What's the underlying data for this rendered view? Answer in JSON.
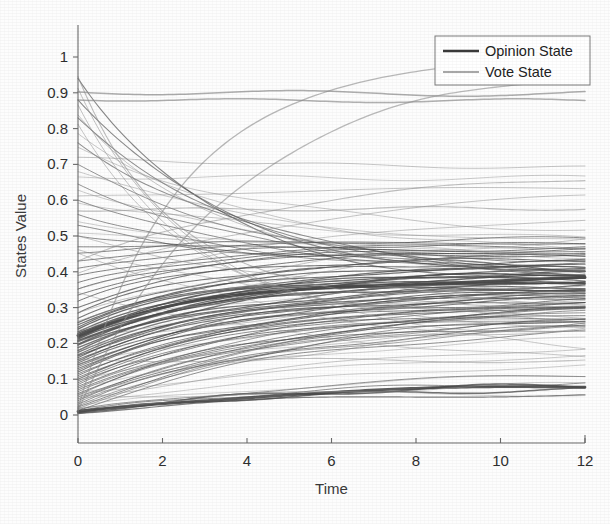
{
  "figure": {
    "width": 610,
    "height": 524,
    "background": "#fdfdfd"
  },
  "chart_data": {
    "type": "line",
    "title": "",
    "xlabel": "Time",
    "ylabel": "States Value",
    "xlim": [
      0,
      12
    ],
    "ylim": [
      -0.06,
      1.08
    ],
    "xticks": [
      0,
      2,
      4,
      6,
      8,
      10,
      12
    ],
    "xtick_labels": [
      "0",
      "2",
      "4",
      "6",
      "8",
      "10",
      "12"
    ],
    "yticks": [
      0,
      0.1,
      0.2,
      0.3,
      0.4,
      0.5,
      0.6,
      0.7,
      0.8,
      0.9,
      1
    ],
    "ytick_labels": [
      "0",
      "0.1",
      "0.2",
      "0.3",
      "0.4",
      "0.5",
      "0.6",
      "0.7",
      "0.8",
      "0.9",
      "1"
    ],
    "grid": false,
    "legend": {
      "position": "top-right",
      "entries": [
        {
          "name": "Opinion State",
          "color": "#3a3a3a",
          "width": 2.6
        },
        {
          "name": "Vote State",
          "color": "#8a8a8a",
          "width": 1.6
        }
      ]
    },
    "series": [
      {
        "name": "Opinion State",
        "color": "#4a4a4a",
        "width": 1.1,
        "opacity": 0.72,
        "description": "Dense family of opinion trajectories converging toward a consensus band near 0.36-0.45 at t=12",
        "curves": [
          {
            "y0": 0.222,
            "yinf": 0.385,
            "rate": 0.3,
            "w": 3.0,
            "op": 0.95
          },
          {
            "y0": 0.01,
            "yinf": 0.082,
            "rate": 0.22,
            "w": 2.8,
            "op": 0.9
          },
          {
            "y0": 0.205,
            "yinf": 0.38,
            "rate": 0.3,
            "w": 1.6,
            "op": 0.8
          },
          {
            "y0": 0.215,
            "yinf": 0.392,
            "rate": 0.31,
            "w": 1.5,
            "op": 0.8
          },
          {
            "y0": 0.195,
            "yinf": 0.372,
            "rate": 0.29,
            "w": 1.4,
            "op": 0.78
          },
          {
            "y0": 0.188,
            "yinf": 0.366,
            "rate": 0.28,
            "w": 1.3,
            "op": 0.75
          },
          {
            "y0": 0.175,
            "yinf": 0.36,
            "rate": 0.28,
            "w": 1.2,
            "op": 0.72
          },
          {
            "y0": 0.165,
            "yinf": 0.352,
            "rate": 0.27,
            "w": 1.2,
            "op": 0.72
          },
          {
            "y0": 0.155,
            "yinf": 0.345,
            "rate": 0.27,
            "w": 1.1,
            "op": 0.7
          },
          {
            "y0": 0.145,
            "yinf": 0.34,
            "rate": 0.26,
            "w": 1.1,
            "op": 0.7
          },
          {
            "y0": 0.135,
            "yinf": 0.334,
            "rate": 0.26,
            "w": 1.0,
            "op": 0.68
          },
          {
            "y0": 0.125,
            "yinf": 0.328,
            "rate": 0.25,
            "w": 1.0,
            "op": 0.68
          },
          {
            "y0": 0.115,
            "yinf": 0.322,
            "rate": 0.25,
            "w": 1.0,
            "op": 0.66
          },
          {
            "y0": 0.105,
            "yinf": 0.318,
            "rate": 0.24,
            "w": 1.0,
            "op": 0.66
          },
          {
            "y0": 0.095,
            "yinf": 0.312,
            "rate": 0.24,
            "w": 0.95,
            "op": 0.64
          },
          {
            "y0": 0.085,
            "yinf": 0.306,
            "rate": 0.23,
            "w": 0.95,
            "op": 0.64
          },
          {
            "y0": 0.075,
            "yinf": 0.3,
            "rate": 0.23,
            "w": 0.9,
            "op": 0.62
          },
          {
            "y0": 0.065,
            "yinf": 0.296,
            "rate": 0.22,
            "w": 0.9,
            "op": 0.62
          },
          {
            "y0": 0.055,
            "yinf": 0.29,
            "rate": 0.22,
            "w": 0.9,
            "op": 0.6
          },
          {
            "y0": 0.045,
            "yinf": 0.285,
            "rate": 0.21,
            "w": 0.9,
            "op": 0.6
          },
          {
            "y0": 0.035,
            "yinf": 0.28,
            "rate": 0.21,
            "w": 0.85,
            "op": 0.58
          },
          {
            "y0": 0.025,
            "yinf": 0.272,
            "rate": 0.2,
            "w": 0.85,
            "op": 0.58
          },
          {
            "y0": 0.018,
            "yinf": 0.265,
            "rate": 0.2,
            "w": 0.85,
            "op": 0.56
          },
          {
            "y0": 0.232,
            "yinf": 0.4,
            "rate": 0.31,
            "w": 1.3,
            "op": 0.78
          },
          {
            "y0": 0.245,
            "yinf": 0.412,
            "rate": 0.32,
            "w": 1.2,
            "op": 0.76
          },
          {
            "y0": 0.258,
            "yinf": 0.42,
            "rate": 0.32,
            "w": 1.2,
            "op": 0.76
          },
          {
            "y0": 0.27,
            "yinf": 0.43,
            "rate": 0.33,
            "w": 1.1,
            "op": 0.74
          },
          {
            "y0": 0.285,
            "yinf": 0.438,
            "rate": 0.33,
            "w": 1.1,
            "op": 0.74
          },
          {
            "y0": 0.3,
            "yinf": 0.445,
            "rate": 0.33,
            "w": 1.1,
            "op": 0.72
          },
          {
            "y0": 0.318,
            "yinf": 0.452,
            "rate": 0.34,
            "w": 1.0,
            "op": 0.72
          },
          {
            "y0": 0.335,
            "yinf": 0.458,
            "rate": 0.34,
            "w": 1.0,
            "op": 0.7
          },
          {
            "y0": 0.352,
            "yinf": 0.462,
            "rate": 0.34,
            "w": 1.0,
            "op": 0.7
          },
          {
            "y0": 0.37,
            "yinf": 0.468,
            "rate": 0.33,
            "w": 1.0,
            "op": 0.68
          },
          {
            "y0": 0.39,
            "yinf": 0.474,
            "rate": 0.32,
            "w": 1.0,
            "op": 0.68
          },
          {
            "y0": 0.41,
            "yinf": 0.48,
            "rate": 0.31,
            "w": 1.0,
            "op": 0.66
          },
          {
            "y0": 0.43,
            "yinf": 0.486,
            "rate": 0.3,
            "w": 1.0,
            "op": 0.66
          },
          {
            "y0": 0.452,
            "yinf": 0.492,
            "rate": 0.29,
            "w": 1.0,
            "op": 0.64
          },
          {
            "y0": 0.47,
            "yinf": 0.462,
            "rate": 0.26,
            "w": 1.0,
            "op": 0.64
          },
          {
            "y0": 0.5,
            "yinf": 0.432,
            "rate": 0.25,
            "w": 1.0,
            "op": 0.62
          },
          {
            "y0": 0.53,
            "yinf": 0.41,
            "rate": 0.24,
            "w": 1.0,
            "op": 0.62
          },
          {
            "y0": 0.56,
            "yinf": 0.398,
            "rate": 0.23,
            "w": 1.0,
            "op": 0.6
          },
          {
            "y0": 0.6,
            "yinf": 0.392,
            "rate": 0.22,
            "w": 1.0,
            "op": 0.6
          },
          {
            "y0": 0.645,
            "yinf": 0.386,
            "rate": 0.21,
            "w": 1.0,
            "op": 0.58
          },
          {
            "y0": 0.7,
            "yinf": 0.38,
            "rate": 0.21,
            "w": 1.0,
            "op": 0.58
          },
          {
            "y0": 0.76,
            "yinf": 0.374,
            "rate": 0.22,
            "w": 1.05,
            "op": 0.6
          },
          {
            "y0": 0.83,
            "yinf": 0.368,
            "rate": 0.24,
            "w": 1.05,
            "op": 0.62
          },
          {
            "y0": 0.88,
            "yinf": 0.36,
            "rate": 0.26,
            "w": 1.05,
            "op": 0.64
          },
          {
            "y0": 0.94,
            "yinf": 0.352,
            "rate": 0.3,
            "w": 1.1,
            "op": 0.66
          },
          {
            "y0": 0.208,
            "yinf": 0.376,
            "rate": 0.295,
            "w": 1.5,
            "op": 0.82
          },
          {
            "y0": 0.198,
            "yinf": 0.384,
            "rate": 0.305,
            "w": 1.4,
            "op": 0.8
          },
          {
            "y0": 0.18,
            "yinf": 0.37,
            "rate": 0.285,
            "w": 1.3,
            "op": 0.78
          },
          {
            "y0": 0.16,
            "yinf": 0.356,
            "rate": 0.275,
            "w": 1.2,
            "op": 0.76
          },
          {
            "y0": 0.14,
            "yinf": 0.342,
            "rate": 0.265,
            "w": 1.2,
            "op": 0.74
          },
          {
            "y0": 0.12,
            "yinf": 0.33,
            "rate": 0.255,
            "w": 1.1,
            "op": 0.72
          },
          {
            "y0": 0.1,
            "yinf": 0.316,
            "rate": 0.245,
            "w": 1.1,
            "op": 0.7
          },
          {
            "y0": 0.08,
            "yinf": 0.304,
            "rate": 0.235,
            "w": 1.0,
            "op": 0.68
          },
          {
            "y0": 0.06,
            "yinf": 0.292,
            "rate": 0.225,
            "w": 1.0,
            "op": 0.66
          },
          {
            "y0": 0.04,
            "yinf": 0.282,
            "rate": 0.215,
            "w": 1.0,
            "op": 0.64
          },
          {
            "y0": 0.022,
            "yinf": 0.268,
            "rate": 0.205,
            "w": 1.0,
            "op": 0.62
          },
          {
            "y0": 0.012,
            "yinf": 0.255,
            "rate": 0.195,
            "w": 1.0,
            "op": 0.6
          },
          {
            "y0": 0.006,
            "yinf": 0.09,
            "rate": 0.2,
            "w": 1.6,
            "op": 0.8
          },
          {
            "y0": 0.008,
            "yinf": 0.076,
            "rate": 0.21,
            "w": 1.5,
            "op": 0.78
          },
          {
            "y0": 0.004,
            "yinf": 0.066,
            "rate": 0.19,
            "w": 1.2,
            "op": 0.7
          },
          {
            "y0": 0.012,
            "yinf": 0.1,
            "rate": 0.18,
            "w": 1.0,
            "op": 0.6
          },
          {
            "y0": 0.016,
            "yinf": 0.126,
            "rate": 0.16,
            "w": 1.0,
            "op": 0.58
          },
          {
            "y0": 0.228,
            "yinf": 0.398,
            "rate": 0.315,
            "w": 1.6,
            "op": 0.86
          },
          {
            "y0": 0.218,
            "yinf": 0.39,
            "rate": 0.308,
            "w": 1.5,
            "op": 0.84
          },
          {
            "y0": 0.212,
            "yinf": 0.382,
            "rate": 0.3,
            "w": 1.4,
            "op": 0.82
          },
          {
            "y0": 0.24,
            "yinf": 0.405,
            "rate": 0.318,
            "w": 1.3,
            "op": 0.8
          },
          {
            "y0": 0.252,
            "yinf": 0.415,
            "rate": 0.322,
            "w": 1.2,
            "op": 0.78
          },
          {
            "y0": 0.168,
            "yinf": 0.358,
            "rate": 0.272,
            "w": 1.2,
            "op": 0.74
          },
          {
            "y0": 0.15,
            "yinf": 0.348,
            "rate": 0.262,
            "w": 1.1,
            "op": 0.72
          },
          {
            "y0": 0.13,
            "yinf": 0.336,
            "rate": 0.252,
            "w": 1.1,
            "op": 0.7
          },
          {
            "y0": 0.11,
            "yinf": 0.324,
            "rate": 0.242,
            "w": 1.0,
            "op": 0.68
          },
          {
            "y0": 0.09,
            "yinf": 0.31,
            "rate": 0.232,
            "w": 1.0,
            "op": 0.66
          },
          {
            "y0": 0.07,
            "yinf": 0.298,
            "rate": 0.222,
            "w": 1.0,
            "op": 0.64
          },
          {
            "y0": 0.05,
            "yinf": 0.288,
            "rate": 0.212,
            "w": 1.0,
            "op": 0.62
          },
          {
            "y0": 0.03,
            "yinf": 0.276,
            "rate": 0.202,
            "w": 1.0,
            "op": 0.6
          }
        ]
      },
      {
        "name": "Vote State",
        "color": "#8e8e8e",
        "width": 1.0,
        "opacity": 0.55,
        "description": "Lighter vote trajectories including stubborn agents held near 0.90 and 0.88, slow risers to 0.97, and decliners",
        "curves": [
          {
            "y0": 0.902,
            "yinf": 0.898,
            "rate": 0.4,
            "w": 1.5,
            "op": 0.72
          },
          {
            "y0": 0.88,
            "yinf": 0.878,
            "rate": 0.4,
            "w": 1.5,
            "op": 0.7
          },
          {
            "y0": 0.018,
            "yinf": 0.99,
            "rate": 0.42,
            "w": 1.3,
            "op": 0.62
          },
          {
            "y0": 0.012,
            "yinf": 0.985,
            "rate": 0.27,
            "w": 1.3,
            "op": 0.6
          },
          {
            "y0": 0.665,
            "yinf": 0.662,
            "rate": 0.4,
            "w": 1.0,
            "op": 0.45
          },
          {
            "y0": 0.57,
            "yinf": 0.578,
            "rate": 0.22,
            "w": 1.2,
            "op": 0.55
          },
          {
            "y0": 0.155,
            "yinf": 0.152,
            "rate": 0.4,
            "w": 1.1,
            "op": 0.5
          },
          {
            "y0": 0.72,
            "yinf": 0.686,
            "rate": 0.16,
            "w": 1.0,
            "op": 0.5
          },
          {
            "y0": 0.612,
            "yinf": 0.638,
            "rate": 0.14,
            "w": 1.0,
            "op": 0.5
          },
          {
            "y0": 0.43,
            "yinf": 0.69,
            "rate": 0.18,
            "w": 1.1,
            "op": 0.55
          },
          {
            "y0": 0.396,
            "yinf": 0.64,
            "rate": 0.17,
            "w": 1.0,
            "op": 0.52
          },
          {
            "y0": 0.352,
            "yinf": 0.582,
            "rate": 0.16,
            "w": 1.0,
            "op": 0.5
          },
          {
            "y0": 0.285,
            "yinf": 0.53,
            "rate": 0.15,
            "w": 1.0,
            "op": 0.5
          },
          {
            "y0": 0.262,
            "yinf": 0.498,
            "rate": 0.15,
            "w": 1.0,
            "op": 0.48
          },
          {
            "y0": 0.5,
            "yinf": 0.262,
            "rate": 0.13,
            "w": 1.0,
            "op": 0.5
          },
          {
            "y0": 0.462,
            "yinf": 0.196,
            "rate": 0.12,
            "w": 1.0,
            "op": 0.5
          },
          {
            "y0": 0.452,
            "yinf": 0.122,
            "rate": 0.13,
            "w": 1.0,
            "op": 0.48
          },
          {
            "y0": 0.342,
            "yinf": 0.118,
            "rate": 0.14,
            "w": 1.0,
            "op": 0.48
          },
          {
            "y0": 0.06,
            "yinf": 0.312,
            "rate": 0.11,
            "w": 1.0,
            "op": 0.5
          },
          {
            "y0": 0.046,
            "yinf": 0.254,
            "rate": 0.1,
            "w": 1.0,
            "op": 0.48
          },
          {
            "y0": 0.058,
            "yinf": 0.2,
            "rate": 0.12,
            "w": 1.0,
            "op": 0.46
          },
          {
            "y0": 0.054,
            "yinf": 0.06,
            "rate": 0.2,
            "w": 1.0,
            "op": 0.42
          },
          {
            "y0": 0.838,
            "yinf": 0.386,
            "rate": 0.3,
            "w": 1.0,
            "op": 0.5
          },
          {
            "y0": 0.786,
            "yinf": 0.452,
            "rate": 0.26,
            "w": 1.0,
            "op": 0.48
          },
          {
            "y0": 0.748,
            "yinf": 0.5,
            "rate": 0.22,
            "w": 1.0,
            "op": 0.48
          },
          {
            "y0": 0.68,
            "yinf": 0.466,
            "rate": 0.2,
            "w": 1.0,
            "op": 0.46
          },
          {
            "y0": 0.628,
            "yinf": 0.42,
            "rate": 0.19,
            "w": 1.0,
            "op": 0.46
          },
          {
            "y0": 0.592,
            "yinf": 0.478,
            "rate": 0.17,
            "w": 1.0,
            "op": 0.46
          },
          {
            "y0": 0.54,
            "yinf": 0.436,
            "rate": 0.18,
            "w": 1.0,
            "op": 0.44
          },
          {
            "y0": 0.508,
            "yinf": 0.462,
            "rate": 0.16,
            "w": 1.0,
            "op": 0.44
          },
          {
            "y0": 0.945,
            "yinf": 0.304,
            "rate": 0.44,
            "w": 1.1,
            "op": 0.58
          },
          {
            "y0": 0.912,
            "yinf": 0.268,
            "rate": 0.4,
            "w": 1.0,
            "op": 0.54
          },
          {
            "y0": 0.866,
            "yinf": 0.24,
            "rate": 0.36,
            "w": 1.0,
            "op": 0.52
          },
          {
            "y0": 0.812,
            "yinf": 0.214,
            "rate": 0.32,
            "w": 1.0,
            "op": 0.5
          },
          {
            "y0": 0.236,
            "yinf": 0.372,
            "rate": 0.24,
            "w": 1.0,
            "op": 0.5
          },
          {
            "y0": 0.206,
            "yinf": 0.344,
            "rate": 0.22,
            "w": 1.0,
            "op": 0.48
          },
          {
            "y0": 0.182,
            "yinf": 0.326,
            "rate": 0.21,
            "w": 1.0,
            "op": 0.48
          },
          {
            "y0": 0.142,
            "yinf": 0.29,
            "rate": 0.19,
            "w": 1.0,
            "op": 0.46
          },
          {
            "y0": 0.098,
            "yinf": 0.262,
            "rate": 0.17,
            "w": 1.0,
            "op": 0.46
          },
          {
            "y0": 0.076,
            "yinf": 0.236,
            "rate": 0.16,
            "w": 1.0,
            "op": 0.44
          },
          {
            "y0": 0.034,
            "yinf": 0.162,
            "rate": 0.14,
            "w": 1.0,
            "op": 0.44
          },
          {
            "y0": 0.026,
            "yinf": 0.134,
            "rate": 0.13,
            "w": 1.0,
            "op": 0.42
          },
          {
            "y0": 0.02,
            "yinf": 0.108,
            "rate": 0.12,
            "w": 1.0,
            "op": 0.42
          }
        ]
      }
    ]
  },
  "geometry": {
    "plot_left": 78,
    "plot_right": 585,
    "plot_top": 25,
    "plot_bottom": 443,
    "y_pixel_at_1": 57,
    "y_pixel_at_0": 415,
    "legend": {
      "x": 435,
      "y": 36,
      "w": 155,
      "h": 49
    }
  }
}
